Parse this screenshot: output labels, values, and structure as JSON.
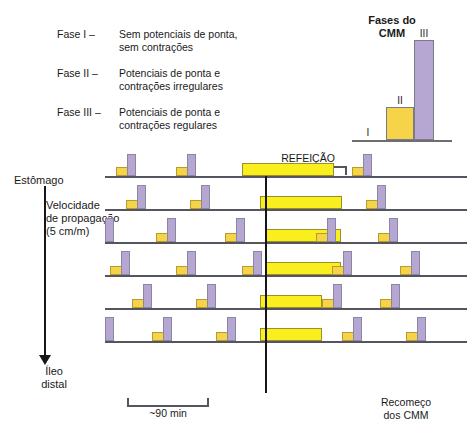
{
  "phases": {
    "rows": [
      {
        "key": "Fase I –",
        "line1": "Sem potenciais de ponta,",
        "line2": "sem contrações"
      },
      {
        "key": "Fase II –",
        "line1": "Potenciais de ponta e",
        "line2": "contrações irregulares"
      },
      {
        "key": "Fase III –",
        "line1": "Potenciais de ponta e",
        "line2": "contrações regulares"
      }
    ]
  },
  "cmm_legend": {
    "title_line1": "Fases do",
    "title_line2": "CMM",
    "label_i": "I",
    "label_ii": "II",
    "label_iii": "III"
  },
  "labels": {
    "estomago": "Estômago",
    "ileo_line1": "Íleo",
    "ileo_line2": "distal",
    "velocidade_line1": "Velocidade",
    "velocidade_line2": "de propagação",
    "velocidade_line3": "(5 cm/m)",
    "refeicao": "REFEIÇÃO",
    "min90": "~90 min",
    "recomeco_line1": "Recomeço",
    "recomeco_line2": "dos CMM"
  },
  "colors": {
    "spike_purple": "#b5a6d2",
    "spike_border": "#8d86a3",
    "nub_yellow": "#f6d44a",
    "nub_border": "#b99a2e",
    "meal_yellow": "#f9ef1f",
    "meal_border": "#9c8f2a",
    "trace_line": "#555560",
    "meal_line": "#15151a"
  },
  "chart_data": {
    "type": "line",
    "xlabel": "Tempo",
    "ylabel": "Posição ao longo do intestino",
    "grid": false,
    "legend": "Fases do CMM: I, II, III",
    "annotations": [
      "REFEIÇÃO",
      "~90 min",
      "Recomeço dos CMM"
    ],
    "meal_line_x": 160,
    "traces": [
      {
        "name": "Estômago",
        "y": 26,
        "spikes": [
          {
            "x": 22,
            "height": 22
          },
          {
            "x": 82,
            "height": 22
          },
          {
            "x": 258,
            "height": 22
          }
        ],
        "nubs": [
          {
            "x": 11,
            "width": 12
          },
          {
            "x": 71,
            "width": 12
          },
          {
            "x": 247,
            "width": 12
          }
        ],
        "meal_bars": [
          {
            "x": 137,
            "width": 92
          }
        ]
      },
      {
        "name": "Trace 2",
        "y": 26,
        "spikes": [
          {
            "x": 32,
            "height": 24
          },
          {
            "x": 96,
            "height": 24
          },
          {
            "x": 272,
            "height": 24
          }
        ],
        "nubs": [
          {
            "x": 21,
            "width": 12
          },
          {
            "x": 85,
            "width": 12
          },
          {
            "x": 261,
            "width": 12
          }
        ],
        "meal_bars": [
          {
            "x": 155,
            "width": 82
          }
        ]
      },
      {
        "name": "Trace 3",
        "y": 26,
        "spikes": [
          {
            "x": 0,
            "height": 24
          },
          {
            "x": 62,
            "height": 24
          },
          {
            "x": 131,
            "height": 24
          },
          {
            "x": 222,
            "height": 24
          },
          {
            "x": 284,
            "height": 24
          }
        ],
        "nubs": [
          {
            "x": 51,
            "width": 12
          },
          {
            "x": 120,
            "width": 12
          },
          {
            "x": 211,
            "width": 12
          },
          {
            "x": 273,
            "width": 12
          }
        ],
        "meal_bars": [
          {
            "x": 160,
            "width": 76
          }
        ]
      },
      {
        "name": "Trace 4",
        "y": 26,
        "spikes": [
          {
            "x": 16,
            "height": 24
          },
          {
            "x": 82,
            "height": 24
          },
          {
            "x": 148,
            "height": 24
          },
          {
            "x": 238,
            "height": 24
          },
          {
            "x": 306,
            "height": 24
          }
        ],
        "nubs": [
          {
            "x": 5,
            "width": 12
          },
          {
            "x": 71,
            "width": 12
          },
          {
            "x": 137,
            "width": 12
          },
          {
            "x": 227,
            "width": 12
          },
          {
            "x": 295,
            "width": 12
          }
        ],
        "meal_bars": [
          {
            "x": 160,
            "width": 76
          }
        ]
      },
      {
        "name": "Trace 5",
        "y": 26,
        "spikes": [
          {
            "x": 38,
            "height": 24
          },
          {
            "x": 102,
            "height": 24
          },
          {
            "x": 228,
            "height": 24
          },
          {
            "x": 286,
            "height": 24
          }
        ],
        "nubs": [
          {
            "x": 27,
            "width": 12
          },
          {
            "x": 91,
            "width": 12
          },
          {
            "x": 217,
            "width": 12
          },
          {
            "x": 275,
            "width": 12
          }
        ],
        "meal_bars": [
          {
            "x": 155,
            "width": 62
          }
        ]
      },
      {
        "name": "Íleo distal",
        "y": 26,
        "spikes": [
          {
            "x": 0,
            "height": 24
          },
          {
            "x": 58,
            "height": 24
          },
          {
            "x": 122,
            "height": 24
          },
          {
            "x": 248,
            "height": 24
          },
          {
            "x": 312,
            "height": 24
          }
        ],
        "nubs": [
          {
            "x": 47,
            "width": 12
          },
          {
            "x": 111,
            "width": 12
          },
          {
            "x": 237,
            "width": 12
          },
          {
            "x": 301,
            "width": 12
          }
        ],
        "meal_bars": [
          {
            "x": 155,
            "width": 62
          }
        ]
      }
    ]
  }
}
